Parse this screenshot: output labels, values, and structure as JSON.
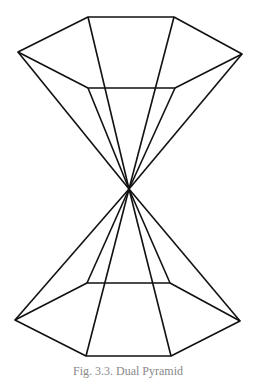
{
  "figure": {
    "apex": [
      129,
      189
    ],
    "top_outer_hexagon": [
      [
        88,
        17
      ],
      [
        174,
        17
      ],
      [
        242,
        54
      ],
      [
        175,
        88
      ],
      [
        88,
        88
      ],
      [
        18,
        52
      ]
    ],
    "bottom_outer_hexagon": [
      [
        87,
        283
      ],
      [
        170,
        283
      ],
      [
        240,
        321
      ],
      [
        171,
        356
      ],
      [
        86,
        356
      ],
      [
        15,
        320
      ]
    ],
    "line_color": "#111111",
    "caption": "Fig. 3.3. Dual Pyramid"
  }
}
